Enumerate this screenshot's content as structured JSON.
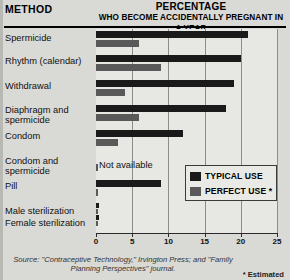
{
  "header": {
    "method_label": "METHOD",
    "percentage_title": "PERCENTAGE",
    "percentage_subtitle": "WHO BECOME ACCIDENTALLY PREGNANT IN A YEAR"
  },
  "legend": {
    "typical_label": "TYPICAL USE",
    "perfect_label": "PERFECT USE *",
    "typical_color": "#1a1a1a",
    "perfect_color": "#595959"
  },
  "footer": {
    "source": "Source: \"Contraceptive Technology,\" Irvington Press; and \"Family Planning Perspectives\" journal.",
    "estimated_note": "* Estimated"
  },
  "na_text": "Not available",
  "chart_data": {
    "type": "bar",
    "orientation": "horizontal",
    "title": "PERCENTAGE WHO BECOME ACCIDENTALLY PREGNANT IN A YEAR",
    "xlabel": "",
    "ylabel": "METHOD",
    "xlim": [
      0,
      25
    ],
    "xticks": [
      0,
      5,
      10,
      15,
      20,
      25
    ],
    "xtick_labels": [
      "0",
      "5",
      "10",
      "15",
      "20",
      "25"
    ],
    "grid": true,
    "legend_position": "inside-right",
    "categories": [
      "Spermicide",
      "Rhythm (calendar)",
      "Withdrawal",
      "Diaphragm and spermicide",
      "Condom",
      "Condom and spermicide",
      "Pill",
      "Male sterilization",
      "Female sterilization"
    ],
    "series": [
      {
        "name": "TYPICAL USE",
        "color": "#1a1a1a",
        "values": [
          21,
          20,
          19,
          18,
          12,
          null,
          9,
          0.4,
          0.4
        ]
      },
      {
        "name": "PERFECT USE *",
        "color": "#595959",
        "values": [
          6,
          9,
          4,
          6,
          3,
          0.1,
          0.3,
          0.15,
          0.2
        ]
      }
    ],
    "annotations": [
      {
        "text": "Not available",
        "category": "Condom and spermicide",
        "series": "TYPICAL USE"
      }
    ]
  }
}
